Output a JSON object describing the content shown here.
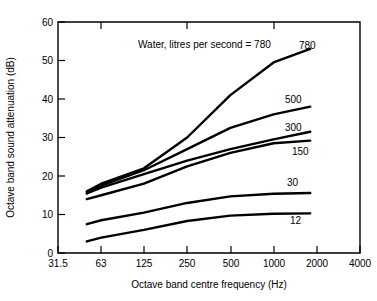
{
  "chart_data": {
    "type": "line",
    "title": "",
    "xlabel": "Octave band centre frequency (Hz)",
    "ylabel": "Octave band sound attenuation (dB)",
    "annotation": "Water, litres per second = 780",
    "annotation_prefix": "Water, litres per second =",
    "x_tick_labels": [
      "31.5",
      "63",
      "125",
      "250",
      "500",
      "1000",
      "2000",
      "4000"
    ],
    "x_tick_values": [
      31.5,
      63,
      125,
      250,
      500,
      1000,
      2000,
      4000
    ],
    "x_scale": "log",
    "xlim": [
      31.5,
      4000
    ],
    "y_tick_labels": [
      "0",
      "10",
      "20",
      "30",
      "40",
      "50",
      "60"
    ],
    "y_tick_values": [
      0,
      10,
      20,
      30,
      40,
      50,
      60
    ],
    "ylim": [
      0,
      60
    ],
    "grid": false,
    "legend_position": "inline-right-of-curves",
    "line_color": "#000000",
    "series": [
      {
        "name": "780",
        "label": "780",
        "x": [
          50,
          63,
          125,
          250,
          500,
          1000,
          1800
        ],
        "values": [
          16.0,
          18.0,
          22.0,
          30.0,
          41.0,
          49.5,
          53.0
        ]
      },
      {
        "name": "500",
        "label": "500",
        "x": [
          50,
          63,
          125,
          250,
          500,
          1000,
          1800
        ],
        "values": [
          15.5,
          17.5,
          21.5,
          27.0,
          32.5,
          36.0,
          38.0
        ]
      },
      {
        "name": "300",
        "label": "300",
        "x": [
          50,
          63,
          125,
          250,
          500,
          1000,
          1800
        ],
        "values": [
          15.5,
          17.0,
          20.5,
          24.0,
          27.0,
          29.5,
          31.5
        ]
      },
      {
        "name": "150",
        "label": "150",
        "x": [
          50,
          63,
          125,
          250,
          500,
          1000,
          1800
        ],
        "values": [
          14.0,
          15.0,
          18.0,
          22.5,
          26.0,
          28.5,
          29.2
        ]
      },
      {
        "name": "30",
        "label": "30",
        "x": [
          50,
          63,
          125,
          250,
          500,
          1000,
          1800
        ],
        "values": [
          7.5,
          8.5,
          10.5,
          13.0,
          14.7,
          15.4,
          15.6
        ]
      },
      {
        "name": "12",
        "label": "12",
        "x": [
          50,
          63,
          125,
          250,
          500,
          1000,
          1800
        ],
        "values": [
          3.0,
          4.0,
          6.0,
          8.3,
          9.7,
          10.2,
          10.3
        ]
      }
    ],
    "series_label_positions": [
      {
        "name": "780",
        "label": "780",
        "x_px": 299,
        "y_px": 49
      },
      {
        "name": "500",
        "label": "500",
        "x_px": 285,
        "y_px": 103
      },
      {
        "name": "300",
        "label": "300",
        "x_px": 285,
        "y_px": 131
      },
      {
        "name": "150",
        "label": "150",
        "x_px": 292,
        "y_px": 155
      },
      {
        "name": "30",
        "label": "30",
        "x_px": 287,
        "y_px": 186
      },
      {
        "name": "12",
        "label": "12",
        "x_px": 290,
        "y_px": 224
      }
    ]
  }
}
